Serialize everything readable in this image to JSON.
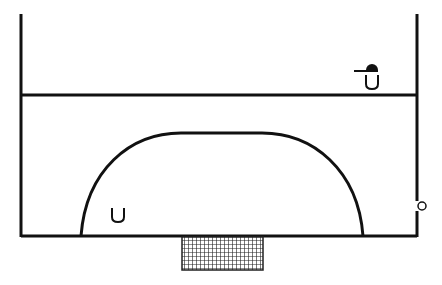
{
  "scene": {
    "type": "basketball-court-top-down",
    "background": "#ffffff",
    "line_color": "#111111",
    "players": [
      {
        "id": "player-with-cap",
        "glyph": "U",
        "x": 371,
        "y": 86,
        "has_cap": true
      },
      {
        "id": "player",
        "glyph": "U",
        "x": 118,
        "y": 224,
        "has_cap": false
      }
    ],
    "ball": {
      "x": 422,
      "y": 206,
      "r": 4
    },
    "net": {
      "x": 182,
      "y": 236,
      "width": 81,
      "height": 34
    }
  }
}
